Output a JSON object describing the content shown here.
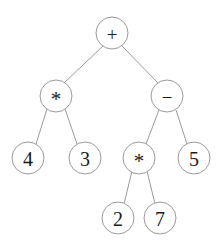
{
  "figure": {
    "kind": "binary-expression-tree",
    "width": 223,
    "height": 244,
    "background_color": "#ffffff",
    "stroke_color": "#9b9b9b",
    "text_color": "#1a1a1a",
    "node_radius": 16,
    "expression": "4 * 3 + (2 * 7 - 5)"
  },
  "nodes": {
    "root": {
      "id": "n0",
      "label": "+",
      "cx": 112,
      "cy": 33
    },
    "mul_left": {
      "id": "n1",
      "label": "*",
      "cx": 56,
      "cy": 96
    },
    "minus_right": {
      "id": "n2",
      "label": "−",
      "cx": 167,
      "cy": 96
    },
    "four": {
      "id": "n3",
      "label": "4",
      "cx": 28,
      "cy": 158
    },
    "three": {
      "id": "n4",
      "label": "3",
      "cx": 85,
      "cy": 158
    },
    "mul_inner": {
      "id": "n5",
      "label": "*",
      "cx": 139,
      "cy": 158
    },
    "five": {
      "id": "n6",
      "label": "5",
      "cx": 194,
      "cy": 158
    },
    "two": {
      "id": "n7",
      "label": "2",
      "cx": 118,
      "cy": 218
    },
    "seven": {
      "id": "n8",
      "label": "7",
      "cx": 160,
      "cy": 218
    }
  },
  "edges": [
    {
      "from": "n0",
      "to": "n1",
      "x1": 103,
      "y1": 46,
      "x2": 64,
      "y2": 83
    },
    {
      "from": "n0",
      "to": "n2",
      "x1": 122,
      "y1": 46,
      "x2": 158,
      "y2": 83
    },
    {
      "from": "n1",
      "to": "n3",
      "x1": 47,
      "y1": 109,
      "x2": 36,
      "y2": 144
    },
    {
      "from": "n1",
      "to": "n4",
      "x1": 65,
      "y1": 109,
      "x2": 77,
      "y2": 144
    },
    {
      "from": "n2",
      "to": "n5",
      "x1": 159,
      "y1": 110,
      "x2": 146,
      "y2": 144
    },
    {
      "from": "n2",
      "to": "n6",
      "x1": 176,
      "y1": 110,
      "x2": 187,
      "y2": 144
    },
    {
      "from": "n5",
      "to": "n7",
      "x1": 132,
      "y1": 171,
      "x2": 124,
      "y2": 204
    },
    {
      "from": "n5",
      "to": "n8",
      "x1": 147,
      "y1": 171,
      "x2": 155,
      "y2": 204
    }
  ]
}
